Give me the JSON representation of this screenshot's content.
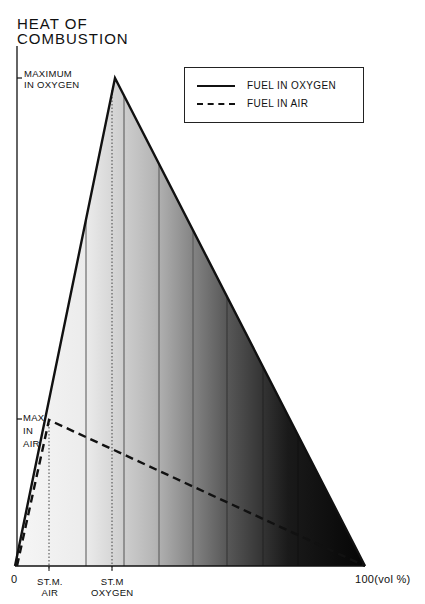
{
  "title": [
    "HEAT OF",
    "COMBUSTION"
  ],
  "y_labels": {
    "max_oxygen": [
      "MAXIMUM",
      "IN OXYGEN"
    ],
    "max_air": [
      "MAX",
      "IN",
      "AIR"
    ]
  },
  "x_labels": {
    "origin": "0",
    "stm_air": [
      "ST.M.",
      "AIR"
    ],
    "stm_oxygen": [
      "ST.M",
      "OXYGEN"
    ],
    "end": "100(vol %)"
  },
  "legend": {
    "items": [
      {
        "label": "FUEL IN OXYGEN",
        "style": "solid"
      },
      {
        "label": "FUEL IN AIR",
        "style": "dashed"
      }
    ]
  },
  "colors": {
    "line": "#111111",
    "fill_light": "#f2f2f2",
    "fill_dark": "#0a0a0a"
  }
}
